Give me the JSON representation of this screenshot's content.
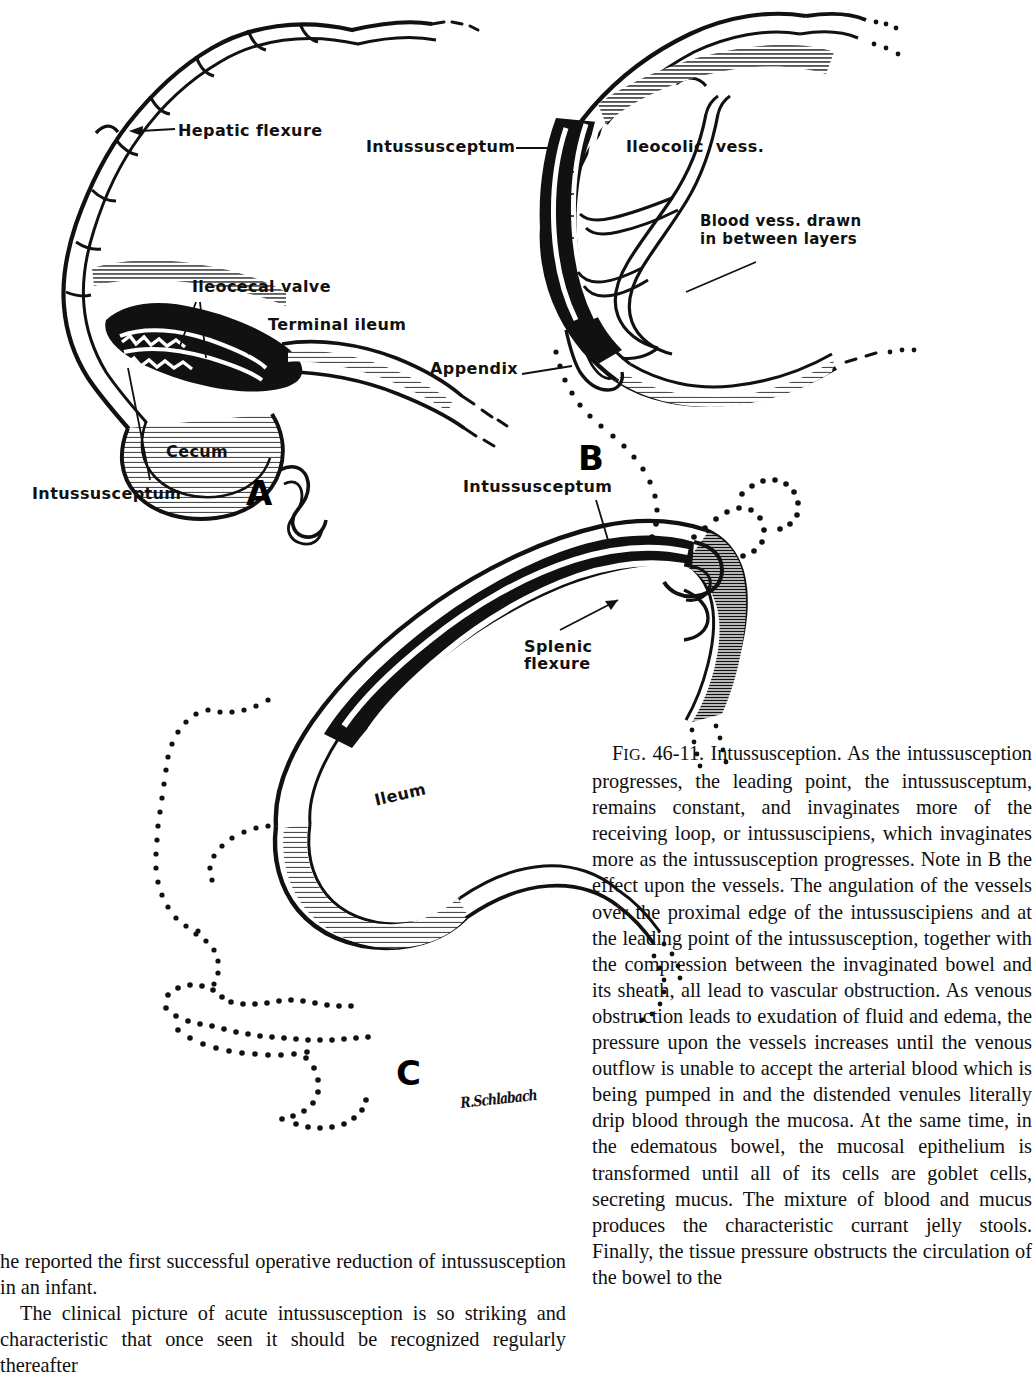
{
  "figure": {
    "panels": [
      {
        "id": "A",
        "letter": "A",
        "labels": [
          {
            "name": "hepatic-flexure",
            "text": "Hepatic flexure"
          },
          {
            "name": "ileocecal-valve",
            "text": "Ileocecal valve"
          },
          {
            "name": "terminal-ileum",
            "text": "Terminal ileum"
          },
          {
            "name": "cecum",
            "text": "Cecum"
          },
          {
            "name": "intussusceptum",
            "text": "Intussusceptum"
          }
        ]
      },
      {
        "id": "B",
        "letter": "B",
        "labels": [
          {
            "name": "intussusceptum",
            "text": "Intussusceptum"
          },
          {
            "name": "ileocolic-vess",
            "text": "Ileocolic  vess."
          },
          {
            "name": "blood-vess-drawn-line1",
            "text": "Blood vess. drawn"
          },
          {
            "name": "blood-vess-drawn-line2",
            "text": "in between layers"
          },
          {
            "name": "appendix",
            "text": "Appendix"
          }
        ]
      },
      {
        "id": "C",
        "letter": "C",
        "labels": [
          {
            "name": "intussusceptum",
            "text": "Intussusceptum"
          },
          {
            "name": "splenic-flexure-line1",
            "text": "Splenic"
          },
          {
            "name": "splenic-flexure-line2",
            "text": "flexure"
          },
          {
            "name": "ileum",
            "text": "Ileum"
          }
        ]
      }
    ],
    "artist_signature": "R.Schlabach"
  },
  "caption": {
    "figure_number_prefix": "F",
    "figure_number_smallcaps": "IG",
    "figure_number_rest": ". 46-11. ",
    "title": "Intussusception.",
    "body": " As the intussusception progresses, the leading point, the intussusceptum, remains constant, and invaginates more of the receiving loop, or intussuscipiens, which invaginates more as the intussusception progresses. Note in B the effect upon the vessels. The angulation of the vessels over the proximal edge of the intussuscipiens and at the leading point of the intussusception, together with the compression between the invaginated bowel and its sheath, all lead to vascular obstruction. As venous obstruction leads to exudation of fluid and edema, the pressure upon the vessels increases until the venous outflow is unable to accept the arterial blood which is being pumped in and the distended venules literally drip blood through the mucosa. At the same time, in the edematous bowel, the mucosal epithelium is transformed until all of its cells are goblet cells, secreting mucus. The mixture of blood and mucus produces the characteristic currant jelly stools. Finally, the tissue pressure obstructs the circulation of the bowel to the"
  },
  "body_text": {
    "paragraph_continued": "he reported the first successful operative reduction of intussusception in an infant.",
    "paragraph_new": "The clinical picture of acute intussusception is so striking and characteristic that once seen it should be recognized regularly thereafter"
  },
  "colors": {
    "ink": "#101010",
    "paper": "#ffffff",
    "shading": "#3a3a3a"
  }
}
